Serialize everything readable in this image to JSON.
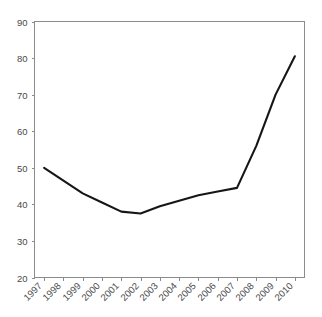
{
  "chart_data": {
    "type": "line",
    "title": "",
    "subtitle": "",
    "xlabel": "",
    "ylabel": "",
    "categories": [
      "1997",
      "1998",
      "1999",
      "2000",
      "2001",
      "2002",
      "2003",
      "2004",
      "2005",
      "2006",
      "2007",
      "2008",
      "2009",
      "2010"
    ],
    "values": [
      50,
      46.5,
      43,
      40.5,
      38,
      37.5,
      39.5,
      41,
      42.5,
      43.5,
      44.5,
      56,
      70,
      80.5
    ],
    "series": [
      {
        "name": "series-1",
        "values": [
          50,
          46.5,
          43,
          40.5,
          38,
          37.5,
          39.5,
          41,
          42.5,
          43.5,
          44.5,
          56,
          70,
          80.5
        ],
        "color": "#161616"
      }
    ],
    "ylim": [
      20,
      90
    ],
    "yticks": [
      20,
      30,
      40,
      50,
      60,
      70,
      80,
      90
    ],
    "ytick_labels": [
      "20",
      "30",
      "40",
      "50",
      "60",
      "70",
      "80",
      "90"
    ],
    "xtick_labels": [
      "1997",
      "1998",
      "1999",
      "2000",
      "2001",
      "2002",
      "2003",
      "2004",
      "2005",
      "2006",
      "2007",
      "2008",
      "2009",
      "2010"
    ],
    "xtick_rotation": -45,
    "grid": false,
    "legend": false,
    "legend_position": "none",
    "axis_color": "#8c8c8c",
    "background_color": "#ffffff",
    "annotations": []
  }
}
